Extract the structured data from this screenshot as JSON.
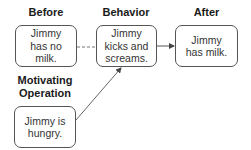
{
  "diagram": {
    "nodes": [
      {
        "id": "before",
        "heading": "Before",
        "text": "Jimmy has no milk."
      },
      {
        "id": "behavior",
        "heading": "Behavior",
        "text": "Jimmy kicks and screams."
      },
      {
        "id": "after",
        "heading": "After",
        "text": "Jimmy has milk."
      },
      {
        "id": "motivating-operation",
        "heading": "Motivating Operation",
        "text": "Jimmy is hungry."
      }
    ],
    "edges": [
      {
        "from": "before",
        "to": "behavior",
        "style": "dashed",
        "arrow": false
      },
      {
        "from": "behavior",
        "to": "after",
        "style": "solid",
        "arrow": true
      },
      {
        "from": "motivating-operation",
        "to": "behavior",
        "style": "solid",
        "arrow": true
      }
    ]
  },
  "labels": {
    "before": "Before",
    "behavior": "Behavior",
    "after": "After",
    "mo_line1": "Motivating",
    "mo_line2": "Operation"
  },
  "boxes": {
    "before_l1": "Jimmy",
    "before_l2": "has no",
    "before_l3": "milk.",
    "behavior_l1": "Jimmy",
    "behavior_l2": "kicks and",
    "behavior_l3": "screams.",
    "after_l1": "Jimmy",
    "after_l2": "has milk.",
    "mo_l1": "Jimmy is",
    "mo_l2": "hungry."
  },
  "colors": {
    "border": "#555555",
    "line": "#555555",
    "text": "#333333"
  }
}
